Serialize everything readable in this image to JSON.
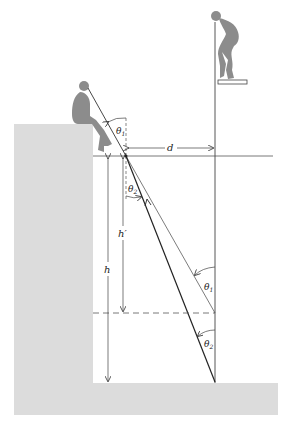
{
  "diagram": {
    "labels": {
      "d": "d",
      "h": "h",
      "h_prime": "h′",
      "theta1_top": "θ",
      "theta1_top_sub": "1",
      "theta2_top": "θ",
      "theta2_top_sub": "2",
      "theta1_bottom": "θ",
      "theta1_bottom_sub": "1",
      "theta2_bottom": "θ",
      "theta2_bottom_sub": "2"
    },
    "figures": [
      "seated-observer",
      "diver-on-board"
    ],
    "colors": {
      "ground": "#d9d9d9",
      "figure": "#8a8a8a",
      "line": "#333333"
    }
  }
}
